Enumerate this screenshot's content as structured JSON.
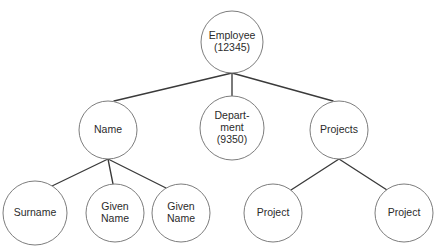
{
  "diagram": {
    "type": "tree",
    "background_color": "#ffffff",
    "edge_color": "#3a3a3a",
    "node_stroke_color": "#7d7d7d",
    "node_fill_color": "#ffffff",
    "text_color": "#2b2b2b",
    "nodes": [
      {
        "id": "employee",
        "lines": [
          "Employee",
          "(12345)"
        ],
        "cx": 232,
        "cy": 42,
        "r": 31,
        "level": 0
      },
      {
        "id": "name",
        "lines": [
          "Name"
        ],
        "cx": 108,
        "cy": 130,
        "r": 29,
        "level": 1
      },
      {
        "id": "department",
        "lines": [
          "Depart-",
          "ment",
          "(9350)"
        ],
        "cx": 232,
        "cy": 128,
        "r": 32,
        "level": 1
      },
      {
        "id": "projects",
        "lines": [
          "Projects"
        ],
        "cx": 339,
        "cy": 130,
        "r": 29,
        "level": 1
      },
      {
        "id": "surname",
        "lines": [
          "Surname"
        ],
        "cx": 35,
        "cy": 213,
        "r": 32,
        "level": 2
      },
      {
        "id": "given-name-1",
        "lines": [
          "Given",
          "Name"
        ],
        "cx": 115,
        "cy": 213,
        "r": 29,
        "level": 2
      },
      {
        "id": "given-name-2",
        "lines": [
          "Given",
          "Name"
        ],
        "cx": 181,
        "cy": 213,
        "r": 29,
        "level": 2
      },
      {
        "id": "project-1",
        "lines": [
          "Project"
        ],
        "cx": 273,
        "cy": 213,
        "r": 29,
        "level": 2
      },
      {
        "id": "project-2",
        "lines": [
          "Project"
        ],
        "cx": 404,
        "cy": 213,
        "r": 29,
        "level": 2
      }
    ],
    "edges": [
      {
        "id": "employee-name",
        "from": "employee",
        "to": "name",
        "x1": 232,
        "y1": 73,
        "x2": 114,
        "y2": 101
      },
      {
        "id": "employee-department",
        "from": "employee",
        "to": "department",
        "x1": 232,
        "y1": 73,
        "x2": 232,
        "y2": 96
      },
      {
        "id": "employee-projects",
        "from": "employee",
        "to": "projects",
        "x1": 232,
        "y1": 73,
        "x2": 333,
        "y2": 101
      },
      {
        "id": "name-surname",
        "from": "name",
        "to": "surname",
        "x1": 108,
        "y1": 159,
        "x2": 52,
        "y2": 186
      },
      {
        "id": "name-given-name-1",
        "from": "name",
        "to": "given-name-1",
        "x1": 108,
        "y1": 159,
        "x2": 113,
        "y2": 184
      },
      {
        "id": "name-given-name-2",
        "from": "name",
        "to": "given-name-2",
        "x1": 108,
        "y1": 159,
        "x2": 166,
        "y2": 188
      },
      {
        "id": "projects-project-1",
        "from": "projects",
        "to": "project-1",
        "x1": 339,
        "y1": 159,
        "x2": 291,
        "y2": 190
      },
      {
        "id": "projects-project-2",
        "from": "projects",
        "to": "project-2",
        "x1": 339,
        "y1": 159,
        "x2": 387,
        "y2": 190
      }
    ]
  }
}
